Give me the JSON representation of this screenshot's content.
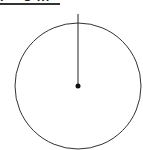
{
  "diagram": {
    "title_clipped": "r = 8 in",
    "shape": "circle",
    "circle": {
      "cx": 78,
      "cy": 86,
      "r": 63,
      "stroke": "#333333"
    },
    "radius_line": {
      "x1": 78,
      "y1": 14,
      "x2": 78,
      "y2": 86,
      "stroke": "#222222"
    },
    "center_point": {
      "cx": 78,
      "cy": 86,
      "r": 2.5,
      "fill": "#111111"
    }
  }
}
